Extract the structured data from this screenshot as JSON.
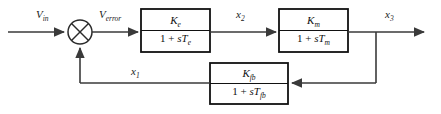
{
  "diagram": {
    "type": "control-system-block-diagram",
    "stroke_color": "#3a3a3a",
    "box_stroke_color": "#111111",
    "text_color": "#111111",
    "background_color": "#ffffff"
  },
  "signals": {
    "input": {
      "base": "V",
      "sub": "in",
      "label": "Vin"
    },
    "error": {
      "base": "V",
      "sub": "error",
      "label": "Verror"
    },
    "x2": {
      "base": "x",
      "sub": "2",
      "label": "x2"
    },
    "x3": {
      "base": "x",
      "sub": "3",
      "label": "x3"
    },
    "x1": {
      "base": "x",
      "sub": "1",
      "label": "x1"
    }
  },
  "summing_junction": {
    "name": "summing-junction",
    "shape": "circle-with-x",
    "center_x": 80,
    "center_y": 32,
    "radius": 12
  },
  "blocks": [
    {
      "id": "forward-block-e",
      "numerator_base": "K",
      "numerator_sub": "e",
      "denominator_prefix": "1 + ",
      "denominator_var": "sT",
      "denominator_sub": "e",
      "transfer_function": "Ke / (1 + sTe)"
    },
    {
      "id": "forward-block-m",
      "numerator_base": "K",
      "numerator_sub": "m",
      "denominator_prefix": "1 + ",
      "denominator_var": "sT",
      "denominator_sub": "m",
      "transfer_function": "Km / (1 + sTm)"
    },
    {
      "id": "feedback-block-fb",
      "numerator_base": "K",
      "numerator_sub": "fb",
      "denominator_prefix": "1 + ",
      "denominator_var": "sT",
      "denominator_sub": "fb",
      "transfer_function": "Kfb / (1 + sTfb)"
    }
  ]
}
